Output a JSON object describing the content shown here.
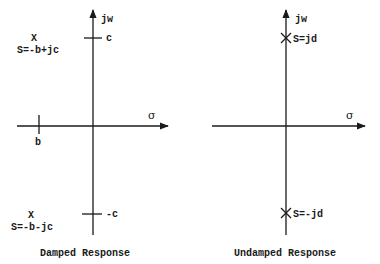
{
  "diagrams": [
    {
      "caption": "Damped Response",
      "vertical_axis_label": "jw",
      "horizontal_axis_label": "σ",
      "tick_labels": {
        "upper_imag": "c",
        "lower_imag": "-c",
        "real": "b"
      },
      "poles": [
        {
          "marker": "X",
          "label": "S=-b+jc"
        },
        {
          "marker": "X",
          "label": "S=-b-jc"
        }
      ]
    },
    {
      "caption": "Undamped Response",
      "vertical_axis_label": "jw",
      "horizontal_axis_label": "σ",
      "poles": [
        {
          "marker": "×",
          "label": "S=jd"
        },
        {
          "marker": "×",
          "label": "S=-jd"
        }
      ]
    }
  ]
}
